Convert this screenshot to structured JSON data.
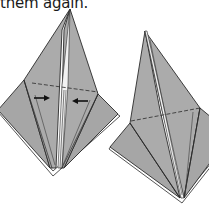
{
  "caption": {
    "text": "them again."
  },
  "figures": [
    {
      "id": "left",
      "description": "Origami base with center slit, horizontal dashed fold line, and two arrows pointing inward",
      "arrows": [
        {
          "direction": "right"
        },
        {
          "direction": "left"
        }
      ],
      "has_dashed_line": true
    },
    {
      "id": "right",
      "description": "Origami base after folding, with horizontal dashed fold line",
      "has_dashed_line": true
    }
  ],
  "colors": {
    "paper_fill": "#a9a9a9",
    "paper_fill_light": "#b3b3b3",
    "edge": "#2a2a2a",
    "slit": "#f2f2f2",
    "background": "#ffffff"
  }
}
